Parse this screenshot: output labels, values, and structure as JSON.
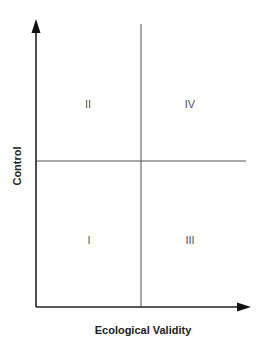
{
  "diagram": {
    "x_axis": {
      "label": "Ecological Validity"
    },
    "y_axis": {
      "label": "Control"
    },
    "quadrants": {
      "top_left": "II",
      "top_right": "IV",
      "bottom_left": "I",
      "bottom_right": "III"
    },
    "colors": {
      "axis": "#222222",
      "divider": "#555555",
      "quadrant_label": "#555555",
      "background": "#ffffff"
    }
  }
}
